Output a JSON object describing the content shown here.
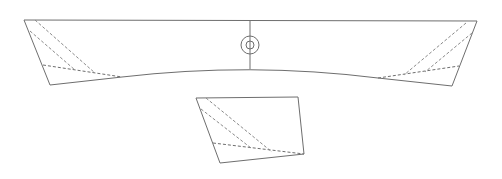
{
  "diagram": {
    "width": 502,
    "height": 179,
    "colors": {
      "background": "#ffffff",
      "stroke": "#6e6e6e",
      "dashed": "#8a8a8a"
    },
    "main_shape": {
      "outline": [
        [
          24,
          20
        ],
        [
          477,
          21
        ],
        [
          452,
          86
        ],
        [
          378,
          78
        ],
        [
          250,
          69
        ],
        [
          122,
          77
        ],
        [
          50,
          85
        ]
      ],
      "top_edge": [
        [
          24,
          20
        ],
        [
          477,
          21
        ]
      ],
      "bottom_curve": {
        "start": [
          122,
          77
        ],
        "control": [
          250,
          62
        ],
        "end": [
          378,
          78
        ]
      },
      "center_line": [
        [
          250,
          20
        ],
        [
          250,
          69
        ]
      ],
      "center_ring": {
        "cx": 250,
        "cy": 45,
        "r_outer": 9,
        "r_inner": 4
      },
      "left_flap": {
        "outline": [
          [
            24,
            20
          ],
          [
            50,
            85
          ],
          [
            122,
            77
          ]
        ],
        "fold_line": [
          [
            43,
            65
          ],
          [
            122,
            77
          ]
        ],
        "dashed_lines": [
          [
            [
              35,
              20
            ],
            [
              95,
              73
            ]
          ],
          [
            [
              30,
              31
            ],
            [
              75,
              70
            ]
          ]
        ]
      },
      "right_flap": {
        "outline": [
          [
            477,
            21
          ],
          [
            452,
            86
          ],
          [
            378,
            78
          ]
        ],
        "fold_line": [
          [
            378,
            78
          ],
          [
            459,
            66
          ]
        ],
        "dashed_lines": [
          [
            [
              466,
              23
            ],
            [
              404,
              75
            ]
          ],
          [
            [
              472,
              33
            ],
            [
              425,
              72
            ]
          ]
        ]
      }
    },
    "detail_shape": {
      "outline": [
        [
          196,
          98
        ],
        [
          298,
          97
        ],
        [
          304,
          154
        ],
        [
          220,
          163
        ]
      ],
      "fold_line": [
        [
          213,
          143
        ],
        [
          304,
          154
        ]
      ],
      "dashed_lines": [
        [
          [
            206,
            98
          ],
          [
            272,
            152
          ]
        ],
        [
          [
            201,
            109
          ],
          [
            251,
            148
          ]
        ]
      ]
    }
  }
}
